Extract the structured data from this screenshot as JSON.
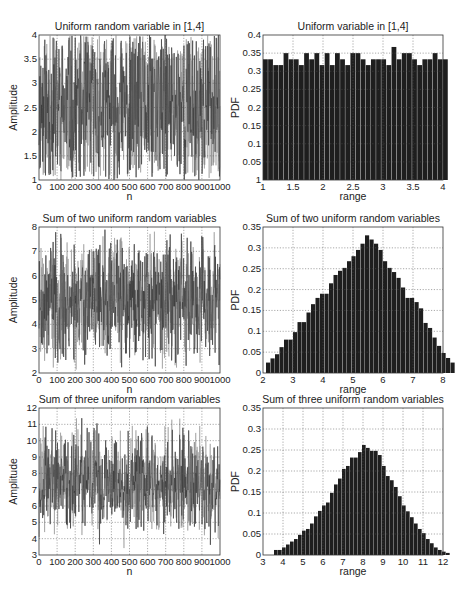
{
  "figure": {
    "layout": "3x2 grid of subplots",
    "colors": {
      "bar": "#1e1e1e",
      "line_dark": "#2a2a2a",
      "line_light": "#8a8a8a",
      "grid": "#555555",
      "axis": "#333333",
      "background": "#ffffff"
    }
  },
  "chart_data": [
    {
      "id": "uniform-time",
      "type": "line",
      "title": "Uniform random variable in [1,4]",
      "xlabel": "n",
      "ylabel": "Amplitude",
      "xlim": [
        0,
        1000
      ],
      "ylim": [
        1,
        4
      ],
      "xticks": [
        0,
        100,
        200,
        300,
        400,
        500,
        600,
        700,
        800,
        900,
        1000
      ],
      "xtick_labels": [
        "0",
        "100",
        "200",
        "300",
        "400",
        "500",
        "600",
        "700",
        "800",
        "900",
        "1000"
      ],
      "yticks": [
        1,
        1.5,
        2,
        2.5,
        3,
        3.5,
        4
      ],
      "ytick_labels": [
        "1",
        "1.5",
        "2",
        "2.5",
        "3",
        "3.5",
        "4"
      ],
      "grid": true,
      "signal": {
        "n_points": 1000,
        "distribution": "uniform",
        "low": 1,
        "high": 4,
        "seed": 11
      }
    },
    {
      "id": "uniform-pdf",
      "type": "bar",
      "title": "Uniform variable in [1,4]",
      "xlabel": "range",
      "ylabel": "PDF",
      "xlim": [
        1,
        4
      ],
      "ylim": [
        0,
        0.4
      ],
      "xticks": [
        1,
        1.5,
        2,
        2.5,
        3,
        3.5,
        4
      ],
      "xtick_labels": [
        "1",
        "1.5",
        "2",
        "2.5",
        "3",
        "3.5",
        "4"
      ],
      "yticks": [
        0,
        0.05,
        0.1,
        0.15,
        0.2,
        0.25,
        0.3,
        0.35,
        0.4
      ],
      "ytick_labels": [
        "1",
        "0.05",
        "0.1",
        "0.15",
        "0.2",
        "0.25",
        "0.3",
        "0.35",
        "0.4"
      ],
      "grid": true,
      "bin_start": 1,
      "bin_width": 0.0857,
      "values": [
        0.333,
        0.333,
        0.317,
        0.317,
        0.35,
        0.333,
        0.333,
        0.317,
        0.35,
        0.333,
        0.35,
        0.317,
        0.35,
        0.317,
        0.35,
        0.333,
        0.317,
        0.35,
        0.35,
        0.333,
        0.317,
        0.333,
        0.333,
        0.333,
        0.317,
        0.367,
        0.333,
        0.35,
        0.35,
        0.333,
        0.317,
        0.333,
        0.333,
        0.35,
        0.333,
        0.333
      ]
    },
    {
      "id": "sum2-time",
      "type": "line",
      "title": "Sum of two uniform random variables",
      "xlabel": "n",
      "ylabel": "Amplitude",
      "xlim": [
        0,
        1000
      ],
      "ylim": [
        2,
        8
      ],
      "xticks": [
        0,
        100,
        200,
        300,
        400,
        500,
        600,
        700,
        800,
        900,
        1000
      ],
      "xtick_labels": [
        "0",
        "100",
        "200",
        "300",
        "400",
        "500",
        "600",
        "700",
        "800",
        "900",
        "1000"
      ],
      "yticks": [
        2,
        3,
        4,
        5,
        6,
        7,
        8
      ],
      "ytick_labels": [
        "2",
        "3",
        "4",
        "5",
        "6",
        "7",
        "8"
      ],
      "grid": true,
      "signal": {
        "n_points": 1000,
        "distribution": "sum of 2 uniform",
        "low": 1,
        "high": 4,
        "seed": 23
      }
    },
    {
      "id": "sum2-pdf",
      "type": "bar",
      "title": "Sum of two uniform random variables",
      "xlabel": "range",
      "ylabel": "PDF",
      "xlim": [
        2,
        8
      ],
      "ylim": [
        0,
        0.35
      ],
      "xticks": [
        2,
        3,
        4,
        5,
        6,
        7,
        8
      ],
      "xtick_labels": [
        "2",
        "3",
        "4",
        "5",
        "6",
        "7",
        "8"
      ],
      "yticks": [
        0,
        0.05,
        0.1,
        0.15,
        0.2,
        0.25,
        0.3,
        0.35
      ],
      "ytick_labels": [
        "0",
        "0.05",
        "0.1",
        "0.15",
        "0.2",
        "0.25",
        "0.3",
        "0.35"
      ],
      "grid": true,
      "bin_start": 2.1,
      "bin_width": 0.15,
      "values": [
        0.025,
        0.035,
        0.045,
        0.062,
        0.08,
        0.08,
        0.098,
        0.122,
        0.122,
        0.145,
        0.165,
        0.18,
        0.19,
        0.19,
        0.215,
        0.235,
        0.245,
        0.252,
        0.268,
        0.28,
        0.295,
        0.31,
        0.33,
        0.32,
        0.31,
        0.295,
        0.268,
        0.252,
        0.242,
        0.228,
        0.205,
        0.18,
        0.18,
        0.17,
        0.155,
        0.12,
        0.108,
        0.085,
        0.065,
        0.048,
        0.036,
        0.025
      ]
    },
    {
      "id": "sum3-time",
      "type": "line",
      "title": "Sum of three uniform random variables",
      "xlabel": "n",
      "ylabel": "Amplitude",
      "xlim": [
        0,
        1000
      ],
      "ylim": [
        3,
        12
      ],
      "xticks": [
        0,
        100,
        200,
        300,
        400,
        500,
        600,
        700,
        800,
        900,
        1000
      ],
      "xtick_labels": [
        "0",
        "100",
        "200",
        "300",
        "400",
        "500",
        "600",
        "700",
        "800",
        "900",
        "1000"
      ],
      "yticks": [
        3,
        4,
        5,
        6,
        7,
        8,
        9,
        10,
        11,
        12
      ],
      "ytick_labels": [
        "3",
        "4",
        "5",
        "6",
        "7",
        "8",
        "9",
        "10",
        "11",
        "12"
      ],
      "grid": true,
      "signal": {
        "n_points": 1000,
        "distribution": "sum of 3 uniform",
        "low": 1,
        "high": 4,
        "seed": 37
      }
    },
    {
      "id": "sum3-pdf",
      "type": "bar",
      "title": "Sum of three uniform random variables",
      "xlabel": "range",
      "ylabel": "PDF",
      "xlim": [
        3,
        12
      ],
      "ylim": [
        0,
        0.35
      ],
      "xticks": [
        3,
        4,
        5,
        6,
        7,
        8,
        9,
        10,
        11,
        12
      ],
      "xtick_labels": [
        "3",
        "4",
        "5",
        "6",
        "7",
        "8",
        "9",
        "10",
        "11",
        "12"
      ],
      "yticks": [
        0,
        0.05,
        0.1,
        0.15,
        0.2,
        0.25,
        0.3,
        0.35
      ],
      "ytick_labels": [
        "0",
        "0.05",
        "0.1",
        "0.15",
        "0.2",
        "0.25",
        "0.3",
        "0.35"
      ],
      "grid": true,
      "bin_start": 3.55,
      "bin_width": 0.2,
      "values": [
        0.012,
        0.012,
        0.018,
        0.025,
        0.032,
        0.038,
        0.048,
        0.058,
        0.062,
        0.075,
        0.092,
        0.105,
        0.118,
        0.125,
        0.148,
        0.168,
        0.182,
        0.205,
        0.212,
        0.232,
        0.232,
        0.245,
        0.262,
        0.255,
        0.248,
        0.248,
        0.238,
        0.212,
        0.188,
        0.178,
        0.162,
        0.14,
        0.118,
        0.104,
        0.09,
        0.075,
        0.062,
        0.052,
        0.038,
        0.028,
        0.018,
        0.012,
        0.008,
        0.005
      ]
    }
  ]
}
